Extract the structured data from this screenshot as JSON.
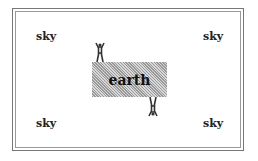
{
  "diagram": {
    "sky_labels": [
      "sky",
      "sky",
      "sky",
      "sky"
    ],
    "earth_label": "earth",
    "figures": [
      {
        "name": "person-standing-on-top",
        "orientation": "upright"
      },
      {
        "name": "person-hanging-below",
        "orientation": "upside-down"
      }
    ],
    "colors": {
      "earth_fill": "#bbbbbb",
      "text": "#222222",
      "border": "#777777",
      "figure": "#333333"
    }
  }
}
